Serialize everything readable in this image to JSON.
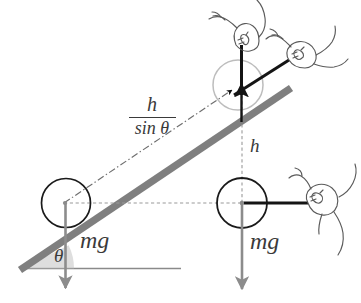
{
  "figure": {
    "labels": {
      "distance_along_incline_numerator": "h",
      "distance_along_incline_denominator": "sin θ",
      "height": "h",
      "weight_left": "mg",
      "weight_right": "mg",
      "angle": "θ"
    },
    "colors": {
      "incline_bar": "#7f7f7f",
      "ground_line": "#808080",
      "circle_outline": "#1a1a1a",
      "weight_arrow": "#8c8c8c",
      "force_arrow": "#111111",
      "dashed_guide": "#9a9a9a",
      "hand_outline": "#5a5a5a",
      "angle_wedge": "#b5b5b5",
      "background": "#ffffff"
    },
    "elements": {
      "left_ball": "ball-on-incline",
      "right_ball": "ball-lifted-vertically",
      "incline": "inclined-ramp",
      "ground": "horizontal-ground-line",
      "hand_top_vertical": "hand-pulling-straight-up",
      "hand_top_incline": "hand-pulling-along-incline",
      "hand_right_horizontal": "hand-pulling-horizontally"
    }
  }
}
